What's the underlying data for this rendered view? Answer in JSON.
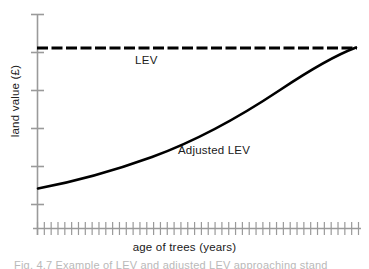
{
  "figure": {
    "background_color": "#ffffff",
    "caption": "Fig. 4.7 Example of LEV and adjusted LEV approaching stand"
  },
  "labels": {
    "lev": "LEV",
    "adjusted_lev": "Adjusted LEV",
    "x_axis": "age of trees (years)",
    "y_axis": "land value (£)"
  },
  "colors": {
    "axis": "#9a9a9a",
    "curve": "#000000",
    "dashed_line": "#000000",
    "text": "#202020",
    "caption": "#b9b9b9"
  },
  "chart_data": {
    "type": "line",
    "title": "",
    "xlabel": "age of trees (years)",
    "ylabel": "land value (£)",
    "grid": false,
    "legend": "inline-annotations",
    "axis_ticks": {
      "x_tick_count": 48,
      "x_tick_labels": [],
      "y_tick_count": 5,
      "y_tick_labels": []
    },
    "xlim": [
      0,
      100
    ],
    "ylim": [
      0,
      100
    ],
    "series": [
      {
        "name": "LEV",
        "style": "dashed",
        "annotation": "LEV",
        "x": [
          0,
          100
        ],
        "values": [
          82,
          82
        ]
      },
      {
        "name": "Adjusted LEV",
        "style": "solid",
        "annotation": "Adjusted LEV",
        "x": [
          0,
          5,
          10,
          15,
          20,
          25,
          30,
          35,
          40,
          45,
          50,
          55,
          60,
          65,
          70,
          75,
          80,
          85,
          90,
          95,
          100
        ],
        "values": [
          18,
          20,
          22,
          24,
          26,
          28,
          31,
          33,
          36,
          39,
          42,
          45,
          49,
          53,
          57,
          61,
          66,
          70,
          74,
          78,
          82
        ]
      }
    ]
  }
}
